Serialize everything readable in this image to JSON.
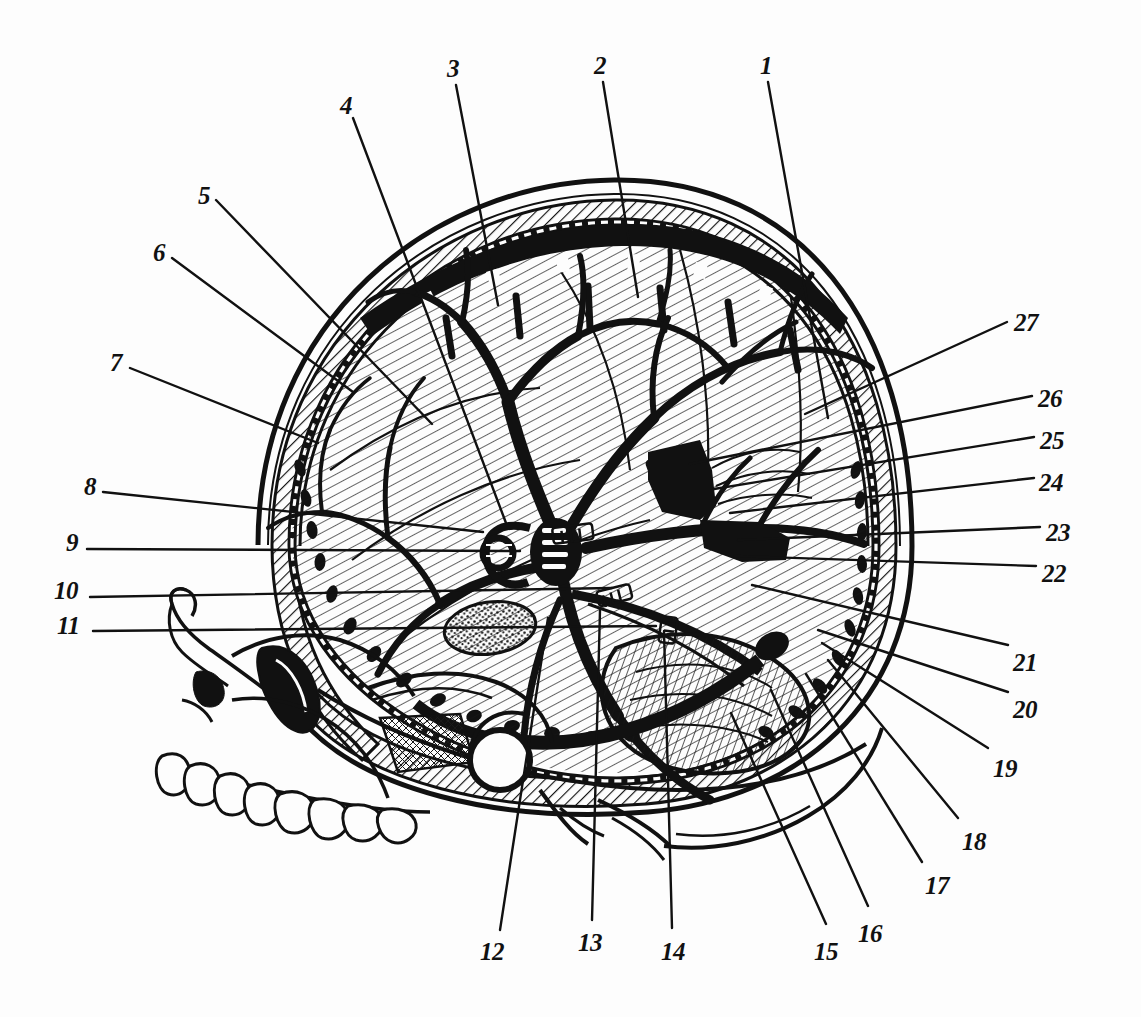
{
  "figure": {
    "type": "labeled-anatomical-illustration",
    "style": "black-and-white line engraving",
    "background_color": "#fdfdfd",
    "ink_color": "#111111",
    "width": 1141,
    "height": 1017
  },
  "callouts": [
    {
      "id": "1",
      "label": "1",
      "text_x": 760,
      "text_y": 53,
      "line": [
        [
          768,
          82
        ],
        [
          828,
          418
        ]
      ]
    },
    {
      "id": "2",
      "label": "2",
      "text_x": 594,
      "text_y": 53,
      "line": [
        [
          603,
          82
        ],
        [
          638,
          297
        ]
      ]
    },
    {
      "id": "3",
      "label": "3",
      "text_x": 447,
      "text_y": 56,
      "line": [
        [
          456,
          85
        ],
        [
          498,
          305
        ]
      ]
    },
    {
      "id": "4",
      "label": "4",
      "text_x": 340,
      "text_y": 93,
      "line": [
        [
          353,
          118
        ],
        [
          506,
          523
        ]
      ]
    },
    {
      "id": "5",
      "label": "5",
      "text_x": 198,
      "text_y": 183,
      "line": [
        [
          216,
          200
        ],
        [
          432,
          424
        ]
      ]
    },
    {
      "id": "6",
      "label": "6",
      "text_x": 153,
      "text_y": 240,
      "line": [
        [
          172,
          258
        ],
        [
          353,
          392
        ]
      ]
    },
    {
      "id": "7",
      "label": "7",
      "text_x": 110,
      "text_y": 350,
      "line": [
        [
          130,
          368
        ],
        [
          318,
          443
        ]
      ]
    },
    {
      "id": "8",
      "label": "8",
      "text_x": 84,
      "text_y": 474,
      "line": [
        [
          103,
          492
        ],
        [
          483,
          532
        ]
      ]
    },
    {
      "id": "9",
      "label": "9",
      "text_x": 66,
      "text_y": 530,
      "line": [
        [
          87,
          549
        ],
        [
          520,
          551
        ]
      ]
    },
    {
      "id": "10",
      "label": "10",
      "text_x": 54,
      "text_y": 578,
      "line": [
        [
          90,
          597
        ],
        [
          612,
          588
        ]
      ]
    },
    {
      "id": "11",
      "label": "11",
      "text_x": 57,
      "text_y": 613,
      "line": [
        [
          93,
          631
        ],
        [
          656,
          626
        ]
      ]
    },
    {
      "id": "12",
      "label": "12",
      "text_x": 480,
      "text_y": 939,
      "line": [
        [
          500,
          930
        ],
        [
          548,
          618
        ]
      ]
    },
    {
      "id": "13",
      "label": "13",
      "text_x": 578,
      "text_y": 930,
      "line": [
        [
          592,
          920
        ],
        [
          600,
          610
        ]
      ]
    },
    {
      "id": "14",
      "label": "14",
      "text_x": 661,
      "text_y": 939,
      "line": [
        [
          672,
          928
        ],
        [
          664,
          631
        ]
      ]
    },
    {
      "id": "15",
      "label": "15",
      "text_x": 814,
      "text_y": 939,
      "line": [
        [
          826,
          924
        ],
        [
          731,
          713
        ]
      ]
    },
    {
      "id": "16",
      "label": "16",
      "text_x": 858,
      "text_y": 921,
      "line": [
        [
          868,
          906
        ],
        [
          771,
          690
        ]
      ]
    },
    {
      "id": "17",
      "label": "17",
      "text_x": 925,
      "text_y": 873,
      "line": [
        [
          922,
          862
        ],
        [
          806,
          674
        ]
      ]
    },
    {
      "id": "18",
      "label": "18",
      "text_x": 962,
      "text_y": 829,
      "line": [
        [
          958,
          818
        ],
        [
          828,
          660
        ]
      ]
    },
    {
      "id": "19",
      "label": "19",
      "text_x": 993,
      "text_y": 756,
      "line": [
        [
          988,
          748
        ],
        [
          822,
          643
        ]
      ]
    },
    {
      "id": "20",
      "label": "20",
      "text_x": 1013,
      "text_y": 697,
      "line": [
        [
          1008,
          692
        ],
        [
          818,
          630
        ]
      ]
    },
    {
      "id": "21",
      "label": "21",
      "text_x": 1013,
      "text_y": 650,
      "line": [
        [
          1008,
          645
        ],
        [
          752,
          585
        ]
      ]
    },
    {
      "id": "22",
      "label": "22",
      "text_x": 1042,
      "text_y": 561,
      "line": [
        [
          1036,
          566
        ],
        [
          735,
          556
        ]
      ]
    },
    {
      "id": "23",
      "label": "23",
      "text_x": 1046,
      "text_y": 520,
      "line": [
        [
          1040,
          527
        ],
        [
          738,
          540
        ]
      ]
    },
    {
      "id": "24",
      "label": "24",
      "text_x": 1039,
      "text_y": 470,
      "line": [
        [
          1034,
          478
        ],
        [
          730,
          513
        ]
      ]
    },
    {
      "id": "25",
      "label": "25",
      "text_x": 1040,
      "text_y": 428,
      "line": [
        [
          1034,
          437
        ],
        [
          714,
          489
        ]
      ]
    },
    {
      "id": "26",
      "label": "26",
      "text_x": 1038,
      "text_y": 386,
      "line": [
        [
          1032,
          396
        ],
        [
          690,
          464
        ]
      ]
    },
    {
      "id": "27",
      "label": "27",
      "text_x": 1014,
      "text_y": 310,
      "line": [
        [
          1007,
          322
        ],
        [
          805,
          414
        ]
      ]
    }
  ],
  "regions": {
    "cranial_vault": "outer skull table, diploe and inner table shown as a thick hatched band",
    "dura_mater": "dark beaded band lining the inner skull with arachnoid granulations",
    "superior_sagittal_sinus": "triangular sinus along the vault with lacunae",
    "cerebrum": "hatched cerebral hemisphere filling the vault",
    "cerebral_vessels": "thick branching middle cerebral artery tree over the hemisphere",
    "circle_of_willis": "vascular hub at the skull base centre",
    "cerebellum": "hatched lobe in the posterior fossa",
    "facial_skeleton": "maxilla, zygomatic arch, orbit, nasal aperture and upper dentition",
    "transverse_sinus": "dark channel running forward from the occipital region"
  }
}
